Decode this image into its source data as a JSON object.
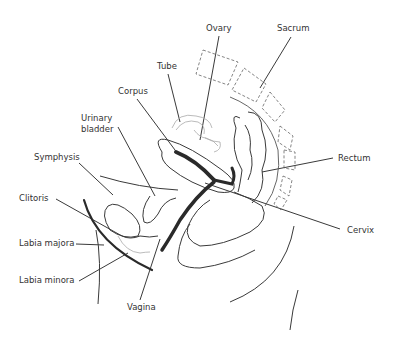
{
  "diagram": {
    "labels": [
      {
        "id": "ovary",
        "text": "Ovary",
        "x": 206,
        "y": 31
      },
      {
        "id": "sacrum",
        "text": "Sacrum",
        "x": 277,
        "y": 31
      },
      {
        "id": "tube",
        "text": "Tube",
        "x": 157,
        "y": 69
      },
      {
        "id": "corpus",
        "text": "Corpus",
        "x": 118,
        "y": 94
      },
      {
        "id": "urinary-bladder-1",
        "text": "Urinary",
        "x": 81,
        "y": 121
      },
      {
        "id": "urinary-bladder-2",
        "text": "bladder",
        "x": 81,
        "y": 132
      },
      {
        "id": "symphysis",
        "text": "Symphysis",
        "x": 34,
        "y": 160
      },
      {
        "id": "rectum",
        "text": "Rectum",
        "x": 338,
        "y": 161
      },
      {
        "id": "clitoris",
        "text": "Clitoris",
        "x": 19,
        "y": 201
      },
      {
        "id": "cervix",
        "text": "Cervix",
        "x": 347,
        "y": 233
      },
      {
        "id": "labia-majora",
        "text": "Labia majora",
        "x": 19,
        "y": 246
      },
      {
        "id": "labia-minora",
        "text": "Labia minora",
        "x": 19,
        "y": 283
      },
      {
        "id": "vagina",
        "text": "Vagina",
        "x": 127,
        "y": 310
      }
    ]
  }
}
